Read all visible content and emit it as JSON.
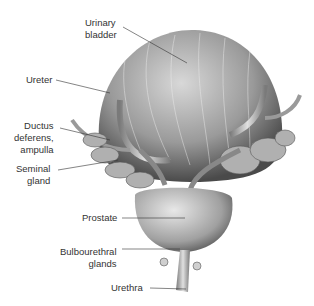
{
  "labels": {
    "urinary_bladder": "Urinary\nbladder",
    "ureter": "Ureter",
    "ductus_deferens": "Ductus\ndeferens,\nampulla",
    "seminal_gland": "Seminal\ngland",
    "prostate": "Prostate",
    "bulbourethral": "Bulbourethral\nglands",
    "urethra": "Urethra"
  }
}
